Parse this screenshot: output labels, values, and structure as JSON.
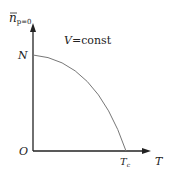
{
  "y_axis": {
    "label": "n",
    "subscript": "p=0"
  },
  "x_axis": {
    "label": "T"
  },
  "origin_label": "O",
  "y_intercept_label": "N",
  "x_intercept_label": "T",
  "x_intercept_sub": "c",
  "annotation": {
    "var": "V",
    "rest": "=const"
  },
  "colors": {
    "axis": "#222222",
    "curve": "#777777"
  }
}
